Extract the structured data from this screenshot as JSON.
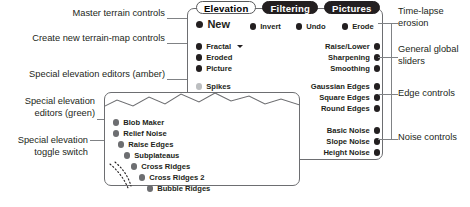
{
  "tabs": [
    {
      "label": "Elevation",
      "state": "active"
    },
    {
      "label": "Filtering",
      "state": "inactive"
    },
    {
      "label": "Pictures",
      "state": "inactive"
    }
  ],
  "main_panel": {
    "top_row": [
      {
        "label": "New",
        "dot": "black"
      },
      {
        "label": "Invert",
        "dot": "black"
      },
      {
        "label": "Undo",
        "dot": "black"
      },
      {
        "label": "Erode",
        "dot": "black"
      }
    ],
    "left_black_group": [
      {
        "label": "Fractal",
        "dot": "black",
        "has_dropdown": true
      },
      {
        "label": "Eroded",
        "dot": "black"
      },
      {
        "label": "Picture",
        "dot": "black"
      }
    ],
    "left_amber_group": [
      {
        "label": "Spikes",
        "dot": "amber"
      },
      {
        "label": "Mounds",
        "dot": "amber"
      },
      {
        "label": "Dampen",
        "dot": "amber"
      },
      {
        "label": "Equalize",
        "dot": "amber"
      },
      {
        "label": "Posterize",
        "dot": "amber"
      },
      {
        "label": "Sawtooth",
        "dot": "amber"
      },
      {
        "label": "Subcontours",
        "dot": "amber"
      }
    ],
    "right_sliders_group": [
      {
        "label": "Raise/Lower",
        "dot": "black"
      },
      {
        "label": "Sharpening",
        "dot": "black"
      },
      {
        "label": "Smoothing",
        "dot": "black"
      }
    ],
    "right_edges_group": [
      {
        "label": "Gaussian Edges",
        "dot": "black"
      },
      {
        "label": "Square Edges",
        "dot": "black"
      },
      {
        "label": "Round Edges",
        "dot": "black"
      }
    ],
    "right_noise_group": [
      {
        "label": "Basic Noise",
        "dot": "black"
      },
      {
        "label": "Slope Noise",
        "dot": "black"
      },
      {
        "label": "Height Noise",
        "dot": "black"
      }
    ]
  },
  "green_panel": {
    "items": [
      {
        "label": "Blob Maker",
        "dot": "green"
      },
      {
        "label": "Relief Noise",
        "dot": "green"
      },
      {
        "label": "Raise Edges",
        "dot": "green"
      },
      {
        "label": "Subplateaus",
        "dot": "green"
      },
      {
        "label": "Cross Ridges",
        "dot": "green"
      },
      {
        "label": "Cross Ridges 2",
        "dot": "green"
      },
      {
        "label": "Bubble Ridges",
        "dot": "green"
      }
    ]
  },
  "annotations": {
    "left": [
      {
        "id": "master-terrain-controls",
        "line1": "Master terrain controls",
        "line2": ""
      },
      {
        "id": "create-new-terrain-map-controls",
        "line1": "Create new terrain-map controls",
        "line2": ""
      },
      {
        "id": "special-elevation-editors-amber",
        "line1": "Special elevation editors (amber)",
        "line2": ""
      },
      {
        "id": "special-elevation-editors-green",
        "line1": "Special elevation",
        "line2": "editors (green)"
      },
      {
        "id": "special-elevation-toggle-switch",
        "line1": "Special elevation",
        "line2": "toggle switch"
      }
    ],
    "right": [
      {
        "id": "time-lapse-erosion",
        "line1": "Time-lapse",
        "line2": "erosion"
      },
      {
        "id": "general-global-sliders",
        "line1": "General global",
        "line2": "sliders"
      },
      {
        "id": "edge-controls",
        "line1": "Edge controls",
        "line2": ""
      },
      {
        "id": "noise-controls",
        "line1": "Noise controls",
        "line2": ""
      }
    ]
  },
  "colors": {
    "black_dot": "#231f20",
    "amber_dot": "#bcbec0",
    "green_dot": "#6d6e71",
    "panel_border": "#6d6e71",
    "leader_line": "#808285",
    "tab_active_bg": "#ffffff",
    "tab_inactive_bg": "#231f20"
  }
}
